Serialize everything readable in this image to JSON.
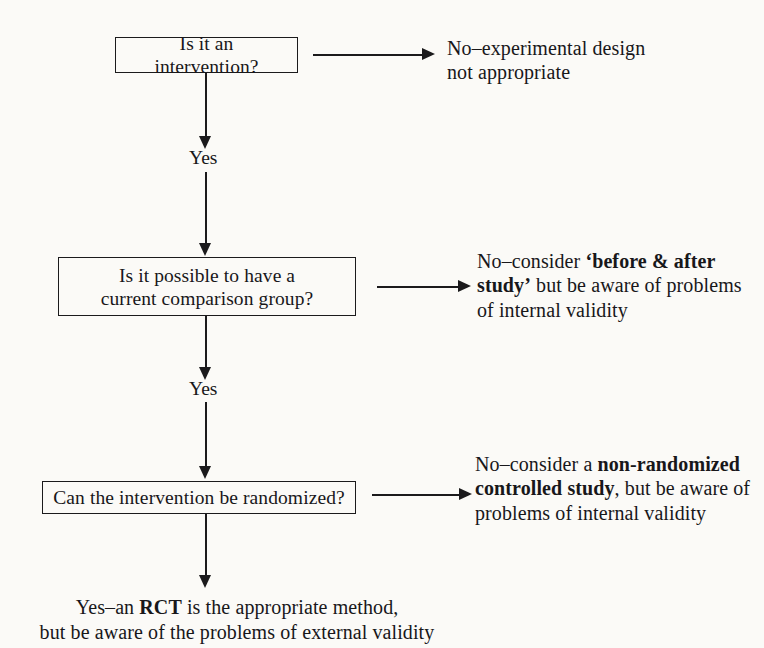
{
  "figure": {
    "type": "flowchart",
    "colors": {
      "ink": "#1b1a1c",
      "page": "#fbfaf7"
    }
  },
  "nodes": {
    "box1": {
      "id": "is-it-an-intervention",
      "text": "Is it an intervention?"
    },
    "box2": {
      "id": "current-comparison-group",
      "line1": "Is it possible to have a",
      "line2": "current comparison group?"
    },
    "box3": {
      "id": "can-be-randomized",
      "text": "Can the intervention be randomized?"
    }
  },
  "edges": {
    "yes1": "Yes",
    "yes2": "Yes"
  },
  "branches": {
    "no1": {
      "line1": "No–experimental design",
      "line2": "not appropriate"
    },
    "no2": {
      "prefix": "No–consider ",
      "bold": "‘before & after study’",
      "suffix": " but be aware of problems of internal validity"
    },
    "no3": {
      "prefix": "No–consider a ",
      "bold": "non-randomized controlled study",
      "suffix": ", but be aware of problems of internal validity"
    }
  },
  "conclusion": {
    "line1_prefix": "Yes–an ",
    "line1_bold": "RCT",
    "line1_suffix": " is the appropriate method,",
    "line2": "but be aware of the problems of external validity"
  }
}
